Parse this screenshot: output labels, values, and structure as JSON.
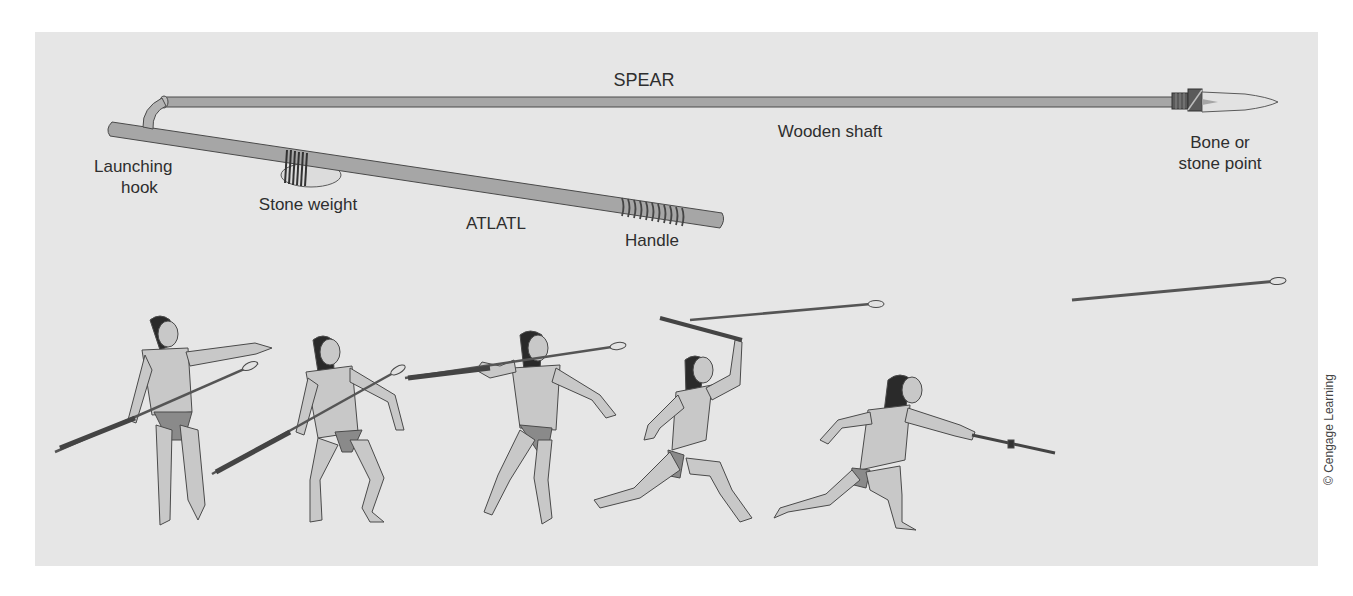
{
  "figure": {
    "type": "diagram",
    "colors": {
      "panel": "#e6e6e6",
      "wood": "#a6a6a6",
      "outline": "#4a4a4a",
      "skin": "#c8c8c8",
      "loincloth": "#8a8a8a",
      "hair": "#2a2a2a",
      "stone": "#dcdcdc"
    }
  },
  "labels": {
    "spear": "SPEAR",
    "wooden_shaft": "Wooden shaft",
    "point_line1": "Bone or",
    "point_line2": "stone point",
    "hook_line1": "Launching",
    "hook_line2": "hook",
    "stone_weight": "Stone weight",
    "atlatl": "ATLATL",
    "handle": "Handle"
  },
  "sequence": {
    "figures": [
      {
        "step": 1,
        "pose": "standing, pointing at target, atlatl held low"
      },
      {
        "step": 2,
        "pose": "crouching, spear angled upward"
      },
      {
        "step": 3,
        "pose": "striding, spear raised to shoulder level"
      },
      {
        "step": 4,
        "pose": "lunging, atlatl raised overhead"
      },
      {
        "step": 5,
        "pose": "follow-through, atlatl extended forward, spear released"
      }
    ],
    "released_spear": "spear in flight"
  },
  "credit": "© Cengage Learning"
}
